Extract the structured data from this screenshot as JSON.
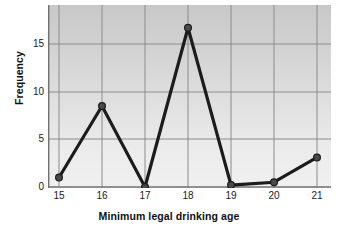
{
  "chart_data": {
    "type": "line",
    "title": "",
    "subtitle": "",
    "xlabel": "Minimum legal drinking age",
    "ylabel": "Frequency",
    "categories": [
      "15",
      "16",
      "17",
      "18",
      "19",
      "20",
      "21"
    ],
    "x": [
      15,
      16,
      17,
      18,
      19,
      20,
      21
    ],
    "values": [
      1,
      8.5,
      0,
      16.7,
      0.2,
      0.5,
      3.1
    ],
    "series": [
      {
        "name": "Frequency",
        "values": [
          1,
          8.5,
          0,
          16.7,
          0.2,
          0.5,
          3.1
        ]
      }
    ],
    "xlim": [
      15,
      21
    ],
    "ylim": [
      0,
      18.6
    ],
    "x_ticks": [
      "15",
      "16",
      "17",
      "18",
      "19",
      "20",
      "21"
    ],
    "y_ticks": [
      "0",
      "5",
      "10",
      "15"
    ],
    "y_tick_values": [
      0,
      5,
      10,
      15
    ],
    "grid": true,
    "legend": false,
    "legend_position": "none",
    "marker": "circle",
    "line_color": "#1c1c1c",
    "marker_color": "#4a4a4a",
    "grid_color": "#8c8c8c",
    "axis_color": "#6e6e6e",
    "plot_background": "#dcdcdc",
    "text_color": "#1a1a1a",
    "annotations": []
  }
}
